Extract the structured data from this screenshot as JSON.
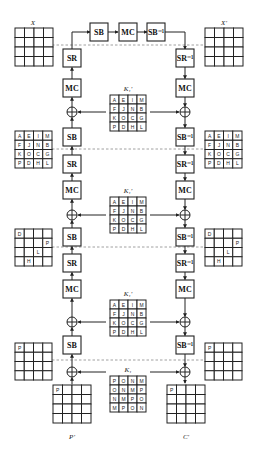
{
  "diagram": {
    "labels": {
      "top_left_state": "X",
      "top_right_state": "X'",
      "bottom_left_state": "P'",
      "bottom_right_state": "C'"
    },
    "top_chain": [
      "SB",
      "MC",
      "SB⁻¹"
    ],
    "left_column": [
      "SR",
      "MC",
      "XOR",
      "SB",
      "SR",
      "MC",
      "XOR",
      "SB",
      "SR",
      "MC",
      "XOR",
      "SB",
      "XOR"
    ],
    "right_column": [
      "SR⁻¹",
      "MC",
      "XOR",
      "SB⁻¹",
      "SR⁻¹",
      "MC",
      "XOR",
      "SB⁻¹",
      "SR⁻¹",
      "MC",
      "XOR",
      "SB⁻¹",
      "XOR"
    ],
    "ops": {
      "SB": "SB",
      "MC": "MC",
      "SR": "SR",
      "SBinv": "SB⁻¹",
      "SRinv": "SR⁻¹"
    },
    "keys": [
      {
        "label": "K₁'",
        "cells": [
          [
            "A",
            "E",
            "I",
            "M"
          ],
          [
            "F",
            "J",
            "N",
            "B"
          ],
          [
            "K",
            "O",
            "C",
            "G"
          ],
          [
            "P",
            "D",
            "H",
            "L"
          ]
        ]
      },
      {
        "label": "K₁'",
        "cells": [
          [
            "A",
            "E",
            "I",
            "M"
          ],
          [
            "F",
            "J",
            "N",
            "B"
          ],
          [
            "K",
            "O",
            "C",
            "G"
          ],
          [
            "P",
            "D",
            "H",
            "L"
          ]
        ]
      },
      {
        "label": "K₁'",
        "cells": [
          [
            "A",
            "E",
            "I",
            "M"
          ],
          [
            "F",
            "J",
            "N",
            "B"
          ],
          [
            "K",
            "O",
            "C",
            "G"
          ],
          [
            "P",
            "D",
            "H",
            "L"
          ]
        ]
      },
      {
        "label": "K₁",
        "cells": [
          [
            "P",
            "O",
            "N",
            "M"
          ],
          [
            "O",
            "N",
            "M",
            "P"
          ],
          [
            "N",
            "M",
            "P",
            "O"
          ],
          [
            "M",
            "P",
            "O",
            "N"
          ]
        ]
      }
    ],
    "states": {
      "X": [
        [
          "",
          "",
          "",
          ""
        ],
        [
          "",
          "",
          "",
          ""
        ],
        [
          "",
          "",
          "",
          ""
        ],
        [
          "",
          "",
          "",
          ""
        ]
      ],
      "X_prime": [
        [
          "",
          "",
          "",
          ""
        ],
        [
          "",
          "",
          "",
          ""
        ],
        [
          "",
          "",
          "",
          ""
        ],
        [
          "",
          "",
          "",
          ""
        ]
      ],
      "mid1_left": [
        [
          "A",
          "E",
          "I",
          "M"
        ],
        [
          "F",
          "J",
          "N",
          "B"
        ],
        [
          "K",
          "O",
          "C",
          "G"
        ],
        [
          "P",
          "D",
          "H",
          "L"
        ]
      ],
      "mid1_right": [
        [
          "A",
          "E",
          "I",
          "M"
        ],
        [
          "F",
          "J",
          "N",
          "B"
        ],
        [
          "K",
          "O",
          "C",
          "G"
        ],
        [
          "P",
          "D",
          "H",
          "L"
        ]
      ],
      "mid2_left": [
        [
          "D",
          "",
          "",
          ""
        ],
        [
          "",
          "",
          "",
          "P"
        ],
        [
          "",
          "",
          "L",
          ""
        ],
        [
          "",
          "H",
          "",
          ""
        ]
      ],
      "mid2_right": [
        [
          "D",
          "",
          "",
          ""
        ],
        [
          "",
          "",
          "",
          "P"
        ],
        [
          "",
          "",
          "L",
          ""
        ],
        [
          "",
          "H",
          "",
          ""
        ]
      ],
      "mid3_left": [
        [
          "P",
          "",
          "",
          ""
        ],
        [
          "",
          "",
          "",
          ""
        ],
        [
          "",
          "",
          "",
          ""
        ],
        [
          "",
          "",
          "",
          ""
        ]
      ],
      "mid3_right": [
        [
          "P",
          "",
          "",
          ""
        ],
        [
          "",
          "",
          "",
          ""
        ],
        [
          "",
          "",
          "",
          ""
        ],
        [
          "",
          "",
          "",
          ""
        ]
      ],
      "P_prime": [
        [
          "P",
          "",
          "",
          ""
        ],
        [
          "",
          "",
          "",
          ""
        ],
        [
          "",
          "",
          "",
          ""
        ],
        [
          "",
          "",
          "",
          ""
        ]
      ],
      "C_prime": [
        [
          "P",
          "",
          "",
          ""
        ],
        [
          "",
          "",
          "",
          ""
        ],
        [
          "",
          "",
          "",
          ""
        ],
        [
          "",
          "",
          "",
          ""
        ]
      ]
    }
  }
}
